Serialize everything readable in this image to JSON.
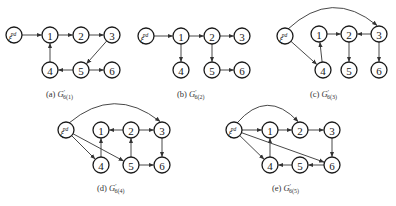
{
  "node_radius": 8,
  "source_label": "ξ",
  "source_sup": "pd",
  "colors": {
    "stroke": "#1a1a1a",
    "edge": "#333333",
    "background": "#ffffff"
  },
  "subgraphs": [
    {
      "id": "a",
      "caption": {
        "prefix": "(a) ",
        "symbol": "G",
        "prime": "′",
        "subscript": "6(1)"
      },
      "caption_pos": [
        46,
        97
      ],
      "nodes": {
        "s": [
          14,
          35
        ],
        "1": [
          50,
          35
        ],
        "2": [
          81,
          35
        ],
        "3": [
          112,
          35
        ],
        "4": [
          50,
          70
        ],
        "5": [
          81,
          70
        ],
        "6": [
          112,
          70
        ]
      },
      "edges": [
        [
          "s",
          "1"
        ],
        [
          "1",
          "2"
        ],
        [
          "2",
          "3"
        ],
        [
          "3",
          "5"
        ],
        [
          "5",
          "4"
        ],
        [
          "5",
          "6"
        ],
        [
          "4",
          "1"
        ]
      ],
      "arcs": []
    },
    {
      "id": "b",
      "caption": {
        "prefix": "(b) ",
        "symbol": "G",
        "prime": "′",
        "subscript": "6(2)"
      },
      "caption_pos": [
        177,
        97
      ],
      "nodes": {
        "s": [
          146,
          36
        ],
        "1": [
          181,
          36
        ],
        "2": [
          212,
          36
        ],
        "3": [
          242,
          36
        ],
        "4": [
          181,
          70
        ],
        "5": [
          212,
          70
        ],
        "6": [
          242,
          70
        ]
      },
      "edges": [
        [
          "s",
          "1"
        ],
        [
          "1",
          "2"
        ],
        [
          "2",
          "3"
        ],
        [
          "1",
          "4"
        ],
        [
          "2",
          "5"
        ],
        [
          "5",
          "6"
        ]
      ],
      "arcs": []
    },
    {
      "id": "c",
      "caption": {
        "prefix": "(c) ",
        "symbol": "G",
        "prime": "′",
        "subscript": "6(3)"
      },
      "caption_pos": [
        310,
        97
      ],
      "nodes": {
        "s": [
          285,
          36
        ],
        "1": [
          319,
          34
        ],
        "2": [
          349,
          34
        ],
        "3": [
          379,
          34
        ],
        "4": [
          323,
          70
        ],
        "5": [
          349,
          70
        ],
        "6": [
          379,
          70
        ]
      },
      "edges": [
        [
          "s",
          "4"
        ],
        [
          "4",
          "1"
        ],
        [
          "1",
          "2"
        ],
        [
          "3",
          "2"
        ],
        [
          "2",
          "5"
        ],
        [
          "3",
          "6"
        ]
      ],
      "arcs": [
        {
          "from": "s",
          "to": "3",
          "cy": -12
        }
      ]
    },
    {
      "id": "d",
      "caption": {
        "prefix": "(d) ",
        "symbol": "G",
        "prime": "′",
        "subscript": "6(4)"
      },
      "caption_pos": [
        97,
        191
      ],
      "nodes": {
        "s": [
          66,
          130
        ],
        "1": [
          101,
          130
        ],
        "2": [
          131,
          130
        ],
        "3": [
          162,
          130
        ],
        "4": [
          101,
          165
        ],
        "5": [
          131,
          165
        ],
        "6": [
          162,
          165
        ]
      },
      "edges": [
        [
          "s",
          "4"
        ],
        [
          "s",
          "5"
        ],
        [
          "4",
          "1"
        ],
        [
          "2",
          "1"
        ],
        [
          "2",
          "3"
        ],
        [
          "5",
          "2"
        ],
        [
          "3",
          "6"
        ],
        [
          "5",
          "6"
        ]
      ],
      "arcs": [
        {
          "from": "s",
          "to": "3",
          "cy": 102
        }
      ]
    },
    {
      "id": "e",
      "caption": {
        "prefix": "(e) ",
        "symbol": "G",
        "prime": "′",
        "subscript": "6(5)"
      },
      "caption_pos": [
        272,
        191
      ],
      "nodes": {
        "s": [
          234,
          130
        ],
        "1": [
          270,
          130
        ],
        "2": [
          300,
          130
        ],
        "3": [
          332,
          130
        ],
        "4": [
          270,
          165
        ],
        "5": [
          300,
          165
        ],
        "6": [
          332,
          165
        ]
      },
      "edges": [
        [
          "s",
          "1"
        ],
        [
          "s",
          "4"
        ],
        [
          "s",
          "6"
        ],
        [
          "1",
          "2"
        ],
        [
          "2",
          "3"
        ],
        [
          "3",
          "6"
        ],
        [
          "6",
          "5"
        ],
        [
          "5",
          "4"
        ],
        [
          "4",
          "1"
        ]
      ],
      "arcs": [
        {
          "from": "s",
          "to": "2",
          "cy": 104
        }
      ]
    }
  ]
}
